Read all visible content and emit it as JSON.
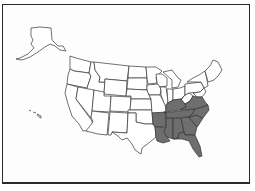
{
  "map": {
    "title": "",
    "subject": "United States",
    "highlight_color": "#6e6e6e",
    "base_color": "#ffffff",
    "highlighted_states": [
      "Arkansas",
      "Louisiana",
      "Mississippi",
      "Alabama",
      "Georgia",
      "Florida",
      "South Carolina",
      "North Carolina",
      "Tennessee",
      "Kentucky",
      "Virginia"
    ]
  }
}
